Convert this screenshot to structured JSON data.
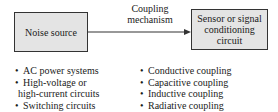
{
  "diagram": {
    "source_box": {
      "label": "Noise source"
    },
    "sink_box": {
      "lines": [
        "Sensor or signal",
        "conditioning",
        "circuit"
      ]
    },
    "connector": {
      "lines": [
        "Coupling",
        "mechanism"
      ],
      "direction": "source-to-sink"
    },
    "source_examples": [
      {
        "text": "AC power systems",
        "bullet": true
      },
      {
        "text": "High-voltage or",
        "bullet": true
      },
      {
        "text": "high-current circuits",
        "bullet": false
      },
      {
        "text": "Switching circuits",
        "bullet": true
      }
    ],
    "coupling_types": [
      {
        "text": "Conductive coupling"
      },
      {
        "text": "Capacitive coupling"
      },
      {
        "text": "Inductive coupling"
      },
      {
        "text": "Radiative coupling"
      }
    ],
    "bullet_char": "•",
    "colors": {
      "box_fill": "#e4e4e4",
      "stroke": "#333333",
      "text": "#1a1a1a"
    }
  }
}
